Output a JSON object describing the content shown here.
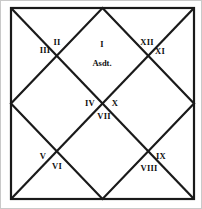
{
  "chart": {
    "type": "astrological-house-chart",
    "style": "north-indian-diamond",
    "background_color": "#ffffff",
    "line_color": "#1a1a1a",
    "outer_border_color": "#c9c9c9",
    "frame": {
      "x": 10,
      "y": 7,
      "width": 183,
      "height": 191
    },
    "ascendant": {
      "label": "Asdt.",
      "x": 101,
      "y": 62
    },
    "houses": [
      {
        "number": 1,
        "label": "I",
        "x": 101,
        "y": 43
      },
      {
        "number": 2,
        "label": "II",
        "x": 56,
        "y": 41
      },
      {
        "number": 3,
        "label": "III",
        "x": 44,
        "y": 49
      },
      {
        "number": 4,
        "label": "IV",
        "x": 89,
        "y": 102
      },
      {
        "number": 5,
        "label": "V",
        "x": 42,
        "y": 155
      },
      {
        "number": 6,
        "label": "VI",
        "x": 56,
        "y": 165
      },
      {
        "number": 7,
        "label": "VII",
        "x": 103,
        "y": 115
      },
      {
        "number": 8,
        "label": "VIII",
        "x": 148,
        "y": 167
      },
      {
        "number": 9,
        "label": "IX",
        "x": 160,
        "y": 155
      },
      {
        "number": 10,
        "label": "X",
        "x": 114,
        "y": 102
      },
      {
        "number": 11,
        "label": "XI",
        "x": 159,
        "y": 50
      },
      {
        "number": 12,
        "label": "XII",
        "x": 146,
        "y": 41
      }
    ]
  }
}
